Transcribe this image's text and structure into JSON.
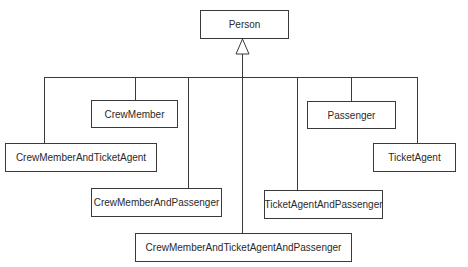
{
  "diagram": {
    "type": "UML class diagram (generalization)",
    "superclass": "Person",
    "classes": {
      "person": "Person",
      "crew_member": "CrewMember",
      "passenger": "Passenger",
      "crew_member_and_ticket_agent": "CrewMemberAndTicketAgent",
      "ticket_agent": "TicketAgent",
      "crew_member_and_passenger": "CrewMemberAndPassenger",
      "ticket_agent_and_passenger": "TicketAgentAndPassenger",
      "crew_member_and_ticket_agent_and_passenger": "CrewMemberAndTicketAgentAndPassenger"
    },
    "relationships": [
      {
        "from": "CrewMember",
        "to": "Person",
        "kind": "generalization"
      },
      {
        "from": "CrewMemberAndTicketAgent",
        "to": "Person",
        "kind": "generalization"
      },
      {
        "from": "CrewMemberAndPassenger",
        "to": "Person",
        "kind": "generalization"
      },
      {
        "from": "CrewMemberAndTicketAgentAndPassenger",
        "to": "Person",
        "kind": "generalization"
      },
      {
        "from": "TicketAgentAndPassenger",
        "to": "Person",
        "kind": "generalization"
      },
      {
        "from": "Passenger",
        "to": "Person",
        "kind": "generalization"
      },
      {
        "from": "TicketAgent",
        "to": "Person",
        "kind": "generalization"
      }
    ],
    "colors": {
      "line": "#3a3a3a",
      "box_fill": "#ffffff",
      "text": "#2a2a2a"
    }
  }
}
